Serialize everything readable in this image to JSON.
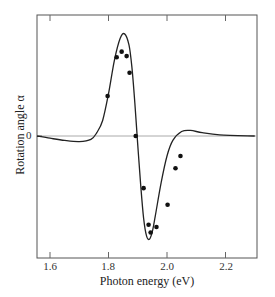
{
  "chart_data": {
    "type": "line",
    "title": "",
    "xlabel": "Photon energy (eV)",
    "ylabel": "Rotation angle α",
    "xlim": [
      1.55,
      2.3
    ],
    "x_ticks": [
      1.6,
      1.8,
      2.0,
      2.2
    ],
    "x_tick_labels": [
      "1.6",
      "1.8",
      "2.0",
      "2.2"
    ],
    "y_ticks": [
      0
    ],
    "y_tick_labels": [
      "0"
    ],
    "ylim": [
      -1.0,
      1.0
    ],
    "grid": false,
    "legend": null,
    "zero_line": true,
    "series": [
      {
        "name": "theory curve",
        "kind": "line",
        "color": "#222222",
        "x": [
          1.55,
          1.6,
          1.65,
          1.7,
          1.74,
          1.76,
          1.78,
          1.8,
          1.82,
          1.84,
          1.855,
          1.87,
          1.88,
          1.89,
          1.9,
          1.91,
          1.92,
          1.93,
          1.94,
          1.95,
          1.96,
          1.98,
          2.0,
          2.02,
          2.05,
          2.08,
          2.12,
          2.18,
          2.3
        ],
        "y": [
          0.0,
          -0.02,
          -0.04,
          -0.05,
          -0.03,
          0.03,
          0.14,
          0.38,
          0.68,
          0.88,
          0.92,
          0.82,
          0.62,
          0.3,
          -0.08,
          -0.44,
          -0.74,
          -0.9,
          -0.93,
          -0.86,
          -0.72,
          -0.42,
          -0.18,
          -0.04,
          0.04,
          0.05,
          0.03,
          0.01,
          0.0
        ]
      },
      {
        "name": "experimental data",
        "kind": "scatter",
        "color": "#111111",
        "x": [
          1.797,
          1.828,
          1.845,
          1.862,
          1.872,
          1.893,
          1.92,
          1.937,
          1.944,
          1.964,
          2.002,
          2.029,
          2.046
        ],
        "y": [
          0.36,
          0.71,
          0.76,
          0.72,
          0.57,
          0.0,
          -0.47,
          -0.8,
          -0.87,
          -0.82,
          -0.62,
          -0.29,
          -0.18
        ]
      }
    ]
  },
  "axes": {
    "xlabel": "Photon energy (eV)",
    "ylabel": "Rotation angle α",
    "x_tick_labels": [
      "1.6",
      "1.8",
      "2.0",
      "2.2"
    ],
    "y_tick_label": "0"
  }
}
